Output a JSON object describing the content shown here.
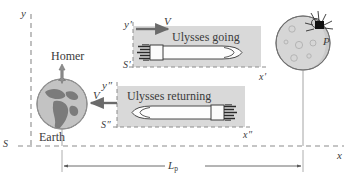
{
  "figure": {
    "background_color": "#ffffff",
    "ink_color": "#3b3b3b",
    "frame_fill_color": "#d9d9d9",
    "earth_color": "#a9a9a9",
    "planet_color": "#d0d0d0"
  },
  "frames": {
    "rest": {
      "name": "S",
      "label": "S",
      "y_axis_label": "y",
      "x_axis_label": "x"
    },
    "outbound": {
      "name": "S'",
      "label": "S′",
      "y_axis_label": "y′",
      "x_axis_label": "x′",
      "caption": "Ulysses going",
      "velocity_label": "V",
      "velocity_direction": "right"
    },
    "inbound": {
      "name": "S''",
      "label": "S″",
      "y_axis_label": "y″",
      "x_axis_label": "x″",
      "caption": "Ulysses returning",
      "velocity_label": "V",
      "velocity_direction": "left"
    }
  },
  "objects": {
    "observer": {
      "label": "Homer",
      "icon": "standing-person-icon"
    },
    "earth": {
      "label": "Earth",
      "icon": "earth-globe-icon"
    },
    "planet": {
      "label": "P",
      "icon": "planet-icon",
      "marker": "lander-probe-icon"
    },
    "ship_outbound": {
      "icon": "rocket-right-icon"
    },
    "ship_inbound": {
      "icon": "rocket-left-icon"
    }
  },
  "measurement": {
    "label_base": "L",
    "label_subscript": "p",
    "label_full": "Lₚ",
    "description": "proper distance between Earth and planet P"
  }
}
